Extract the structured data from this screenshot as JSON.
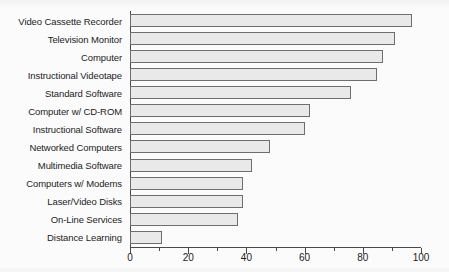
{
  "chart_data": {
    "type": "bar",
    "orientation": "horizontal",
    "title": "",
    "subtitle": "",
    "xlabel": "",
    "ylabel": "",
    "xlim": [
      0,
      100
    ],
    "xticks": [
      0,
      20,
      40,
      60,
      80,
      100
    ],
    "xtick_labels": [
      "0",
      "20",
      "40",
      "60",
      "80",
      "100"
    ],
    "minor_tick_step": 10,
    "grid": false,
    "legend": null,
    "bar_fill_color": "#e9e9e9",
    "bar_edge_color": "#6e6e6e",
    "axis_color": "#4a4a4a",
    "background_color": "#fbfbfb",
    "categories": [
      "Video Cassette Recorder",
      "Television Monitor",
      "Computer",
      "Instructional Videotape",
      "Standard Software",
      "Computer w/ CD-ROM",
      "Instructional Software",
      "Networked Computers",
      "Multimedia Software",
      "Computers w/ Modems",
      "Laser/Video Disks",
      "On-Line Services",
      "Distance Learning"
    ],
    "values": [
      97,
      91,
      87,
      85,
      76,
      62,
      60,
      48,
      42,
      39,
      39,
      37,
      11
    ]
  }
}
